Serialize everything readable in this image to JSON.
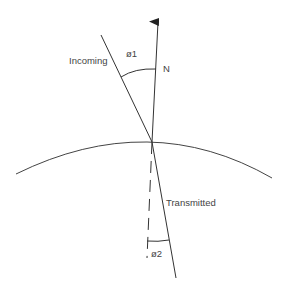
{
  "diagram": {
    "labels": {
      "incoming": "Incoming",
      "normal": "N",
      "angle_incident": "ø1",
      "transmitted": "Transmitted",
      "angle_transmitted": "ø2"
    },
    "colors": {
      "stroke": "#333333",
      "text": "#444444",
      "background": "#ffffff"
    }
  }
}
